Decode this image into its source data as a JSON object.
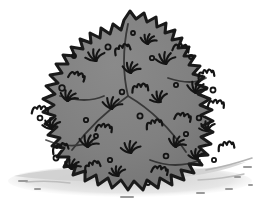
{
  "image": {
    "title": "Bush",
    "subject": "shrub-bush",
    "style": "cartoon-line-drawing",
    "alt_text": "A cartoon shrub: a rounded gray bush with a spiky leafy outline and scattered leaf marks, sitting on a light gray ground shadow.",
    "width": 263,
    "height": 210
  },
  "palette": {
    "background": "#ffffff",
    "foliage_fill": "#808080",
    "foliage_fill_shaded": "#777777",
    "outline": "#1a1a1a",
    "detail_stroke": "#141414",
    "ground_shadow": "#cfcfcf",
    "ground_speckle": "#9a9a9a"
  },
  "elements": {
    "bush_label": "bush",
    "foliage_label": "foliage-mass",
    "outline_label": "spiky-leaf-outline",
    "ground_label": "ground-shadow",
    "speckle_label": "ground-speckles",
    "leaf_sprig_label": "leaf-sprig",
    "squiggle_label": "leaf-squiggle",
    "dot_label": "berry-dot"
  },
  "geometry": {
    "bush_bounds": {
      "x": 15,
      "y": 10,
      "width": 225,
      "height": 182
    },
    "apex": {
      "x": 130,
      "y": 12
    },
    "base_line_y": 190,
    "ground_extent": {
      "x": 8,
      "y": 160,
      "width": 248,
      "height": 35
    }
  },
  "foliage": {
    "spike_count": 96,
    "sprig_count": 26,
    "squiggle_count": 22,
    "dot_count": 34
  },
  "leaf_sprigs": [
    {
      "x": 96,
      "y": 60,
      "r": 11,
      "rot": -14
    },
    {
      "x": 131,
      "y": 72,
      "r": 10,
      "rot": 8
    },
    {
      "x": 166,
      "y": 63,
      "r": 11,
      "rot": -6
    },
    {
      "x": 196,
      "y": 92,
      "r": 11,
      "rot": 12
    },
    {
      "x": 160,
      "y": 101,
      "r": 10,
      "rot": -20
    },
    {
      "x": 112,
      "y": 108,
      "r": 11,
      "rot": 6
    },
    {
      "x": 68,
      "y": 100,
      "r": 10,
      "rot": 18
    },
    {
      "x": 52,
      "y": 128,
      "r": 10,
      "rot": -10
    },
    {
      "x": 88,
      "y": 146,
      "r": 11,
      "rot": 14
    },
    {
      "x": 131,
      "y": 152,
      "r": 11,
      "rot": -4
    },
    {
      "x": 176,
      "y": 146,
      "r": 10,
      "rot": 20
    },
    {
      "x": 208,
      "y": 130,
      "r": 9,
      "rot": -16
    },
    {
      "x": 148,
      "y": 43,
      "r": 9,
      "rot": 10
    },
    {
      "x": 197,
      "y": 158,
      "r": 9,
      "rot": -8
    },
    {
      "x": 72,
      "y": 168,
      "r": 9,
      "rot": 16
    },
    {
      "x": 118,
      "y": 175,
      "r": 9,
      "rot": -12
    }
  ],
  "squiggles": [
    {
      "x": 122,
      "y": 49,
      "rot": -18
    },
    {
      "x": 181,
      "y": 48,
      "rot": 12
    },
    {
      "x": 206,
      "y": 74,
      "rot": -8
    },
    {
      "x": 77,
      "y": 76,
      "rot": 20
    },
    {
      "x": 140,
      "y": 88,
      "rot": -5
    },
    {
      "x": 183,
      "y": 117,
      "rot": 14
    },
    {
      "x": 60,
      "y": 148,
      "rot": -16
    },
    {
      "x": 104,
      "y": 128,
      "rot": 9
    },
    {
      "x": 154,
      "y": 124,
      "rot": -11
    },
    {
      "x": 216,
      "y": 104,
      "rot": 6
    },
    {
      "x": 92,
      "y": 166,
      "rot": -20
    },
    {
      "x": 160,
      "y": 170,
      "rot": 15
    },
    {
      "x": 40,
      "y": 110,
      "rot": 4
    },
    {
      "x": 226,
      "y": 146,
      "rot": -9
    }
  ],
  "dots": [
    {
      "x": 108,
      "y": 47,
      "r": 2.6
    },
    {
      "x": 152,
      "y": 58,
      "r": 2.2
    },
    {
      "x": 191,
      "y": 57,
      "r": 2.0
    },
    {
      "x": 62,
      "y": 88,
      "r": 2.8
    },
    {
      "x": 122,
      "y": 92,
      "r": 2.3
    },
    {
      "x": 176,
      "y": 85,
      "r": 2.1
    },
    {
      "x": 213,
      "y": 90,
      "r": 2.5
    },
    {
      "x": 40,
      "y": 118,
      "r": 2.4
    },
    {
      "x": 86,
      "y": 120,
      "r": 2.2
    },
    {
      "x": 140,
      "y": 116,
      "r": 2.6
    },
    {
      "x": 199,
      "y": 118,
      "r": 2.3
    },
    {
      "x": 56,
      "y": 158,
      "r": 2.5
    },
    {
      "x": 110,
      "y": 160,
      "r": 2.2
    },
    {
      "x": 166,
      "y": 156,
      "r": 2.4
    },
    {
      "x": 214,
      "y": 160,
      "r": 2.1
    },
    {
      "x": 133,
      "y": 33,
      "r": 2.0
    },
    {
      "x": 96,
      "y": 136,
      "r": 2.0
    },
    {
      "x": 186,
      "y": 134,
      "r": 2.2
    },
    {
      "x": 74,
      "y": 56,
      "r": 2.0
    },
    {
      "x": 148,
      "y": 183,
      "r": 2.0
    }
  ],
  "ground_speckles": [
    {
      "x": 243,
      "y": 166,
      "w": 9,
      "h": 2
    },
    {
      "x": 234,
      "y": 176,
      "w": 7,
      "h": 2
    },
    {
      "x": 248,
      "y": 184,
      "w": 5,
      "h": 2
    },
    {
      "x": 225,
      "y": 188,
      "w": 8,
      "h": 2
    },
    {
      "x": 18,
      "y": 180,
      "w": 10,
      "h": 2
    },
    {
      "x": 34,
      "y": 188,
      "w": 7,
      "h": 2
    },
    {
      "x": 120,
      "y": 196,
      "w": 14,
      "h": 2
    },
    {
      "x": 196,
      "y": 192,
      "w": 9,
      "h": 2
    }
  ]
}
